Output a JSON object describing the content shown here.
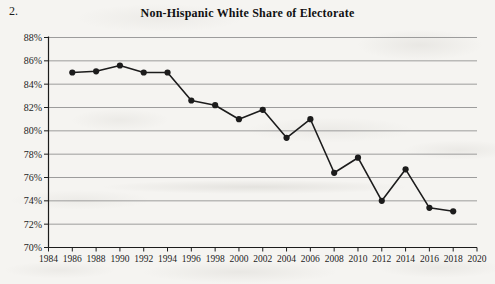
{
  "page": {
    "item_number": "2."
  },
  "chart_data": {
    "type": "line",
    "title": "Non-Hispanic White Share of Electorate",
    "x": [
      1986,
      1988,
      1990,
      1992,
      1994,
      1996,
      1998,
      2000,
      2002,
      2004,
      2006,
      2008,
      2010,
      2012,
      2014,
      2016,
      2018
    ],
    "values": [
      85.0,
      85.1,
      85.6,
      85.0,
      85.0,
      82.6,
      82.2,
      81.0,
      81.8,
      79.4,
      81.0,
      76.4,
      77.7,
      74.0,
      76.7,
      73.4,
      73.1
    ],
    "series_name": "Non-Hispanic White Share",
    "xlabel": "",
    "ylabel": "",
    "xlim": [
      1984,
      2020
    ],
    "ylim": [
      70,
      88
    ],
    "x_ticks": [
      1984,
      1986,
      1988,
      1990,
      1992,
      1994,
      1996,
      1998,
      2000,
      2002,
      2004,
      2006,
      2008,
      2010,
      2012,
      2014,
      2016,
      2018,
      2020
    ],
    "y_tick_labels": [
      "70%",
      "72%",
      "74%",
      "76%",
      "78%",
      "80%",
      "82%",
      "84%",
      "86%",
      "88%"
    ],
    "y_tick_values": [
      70,
      72,
      74,
      76,
      78,
      80,
      82,
      84,
      86,
      88
    ],
    "grid": "horizontal",
    "legend": "none",
    "marker": "filled-circle",
    "colors": {
      "line": "#1c1c1c",
      "marker": "#1c1c1c",
      "grid": "#929292",
      "axis": "#1c1c1c",
      "text": "#1c1c1c"
    }
  }
}
